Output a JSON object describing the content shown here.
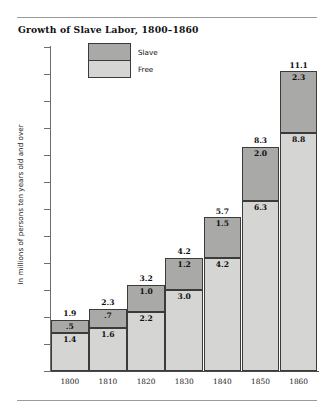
{
  "figure": {
    "title": "Growth of Slave Labor, 1800–1860"
  },
  "legend": {
    "items": [
      {
        "key": "slave",
        "label": "Slave",
        "color": "#a9a9a7"
      },
      {
        "key": "free",
        "label": "Free",
        "color": "#d5d5d3"
      }
    ]
  },
  "axes": {
    "y_title": "In millions of persons ten years old and over",
    "y_ticks": [
      "0",
      "1",
      "2",
      "3",
      "4",
      "5",
      "6",
      "7",
      "8",
      "9",
      "10",
      "11",
      "12"
    ],
    "x_ticks": [
      "1800",
      "1810",
      "1820",
      "1830",
      "1840",
      "1850",
      "1860"
    ]
  },
  "labels": {
    "totals": [
      "1.9",
      "2.3",
      "3.2",
      "4.2",
      "5.7",
      "8.3",
      "11.1"
    ],
    "slave": [
      ".5",
      ".7",
      "1.0",
      "1.2",
      "1.5",
      "2.0",
      "2.3"
    ],
    "free": [
      "1.4",
      "1.6",
      "2.2",
      "3.0",
      "4.2",
      "6.3",
      "8.8"
    ]
  },
  "chart_data": {
    "type": "bar",
    "subtype": "stacked-bar",
    "title": "Growth of Slave Labor, 1800–1860",
    "xlabel": "",
    "ylabel": "In millions of persons ten years old and over",
    "categories": [
      "1800",
      "1810",
      "1820",
      "1830",
      "1840",
      "1850",
      "1860"
    ],
    "series": [
      {
        "name": "Free",
        "color": "#d5d5d3",
        "values": [
          1.4,
          1.6,
          2.2,
          3.0,
          4.2,
          6.3,
          8.8
        ]
      },
      {
        "name": "Slave",
        "color": "#a9a9a7",
        "values": [
          0.5,
          0.7,
          1.0,
          1.2,
          1.5,
          2.0,
          2.3
        ]
      }
    ],
    "totals": [
      1.9,
      2.3,
      3.2,
      4.2,
      5.7,
      8.3,
      11.1
    ],
    "ylim": [
      0,
      12
    ],
    "ytick_step": 1,
    "grid": false,
    "legend_position": "top-left-inside",
    "data_labels": true
  }
}
